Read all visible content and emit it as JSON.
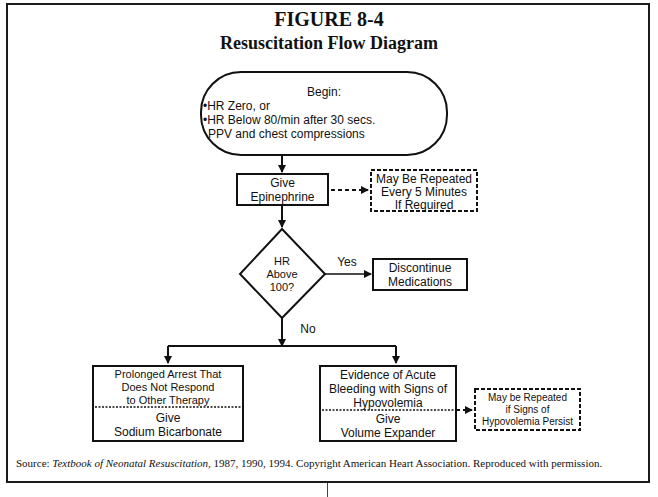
{
  "figure": {
    "number": "FIGURE 8-4",
    "title": "Resuscitation Flow Diagram"
  },
  "nodes": {
    "begin": {
      "heading": "Begin:",
      "line1": "•HR Zero, or",
      "line2": "•HR Below 80/min after 30 secs.",
      "line3": "PPV and chest compressions"
    },
    "epinephrine": {
      "line1": "Give",
      "line2": "Epinephrine"
    },
    "repeat_epi": {
      "line1": "May Be Repeated",
      "line2": "Every 5 Minutes",
      "line3": "If Required"
    },
    "decision": {
      "line1": "HR",
      "line2": "Above",
      "line3": "100?"
    },
    "discontinue": {
      "line1": "Discontinue",
      "line2": "Medications"
    },
    "bicarbonate": {
      "cond1": "Prolonged Arrest That",
      "cond2": "Does Not Respond",
      "cond3": "to Other Therapy",
      "act1": "Give",
      "act2": "Sodium Bicarbonate"
    },
    "volume": {
      "cond1": "Evidence of Acute",
      "cond2": "Bleeding with Signs of",
      "cond3": "Hypovolemia",
      "act1": "Give",
      "act2": "Volume Expander"
    },
    "repeat_volume": {
      "line1": "May be Repeated",
      "line2": "if Signs of",
      "line3": "Hypovolemia Persist"
    }
  },
  "edges": {
    "yes_label": "Yes",
    "no_label": "No"
  },
  "source": {
    "prefix": "Source: ",
    "book": "Textbook of Neonatal Resuscitation,",
    "rest": " 1987, 1990, 1994. Copyright American Heart Association. Reproduced with permission."
  }
}
